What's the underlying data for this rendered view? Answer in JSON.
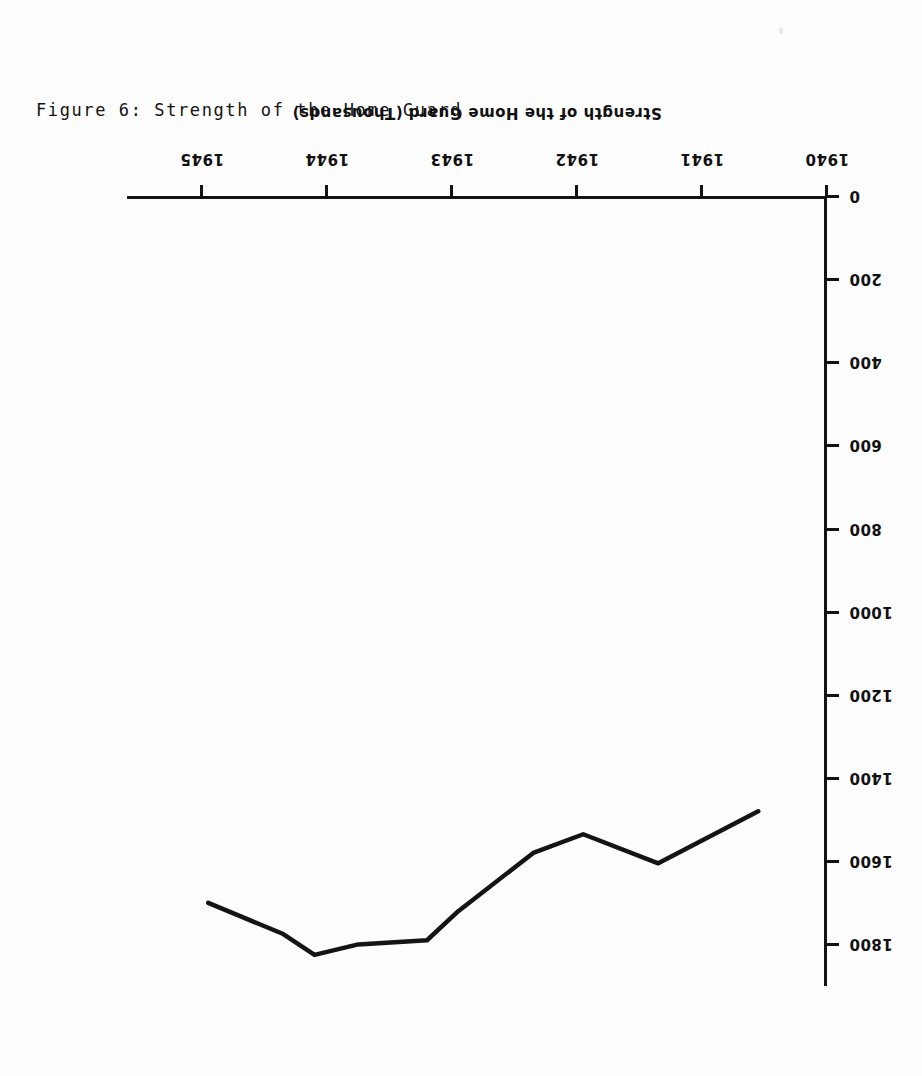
{
  "figure": {
    "caption": "Figure 6: Strength of the Home Guard",
    "orientation_note": "rotated-180"
  },
  "chart_data": {
    "type": "line",
    "title": "Figure 6: Strength of the Home Guard",
    "xlabel": "",
    "ylabel": "Strength of the Home Guard (Thousands)",
    "xlim": [
      1940,
      1945.6
    ],
    "ylim": [
      0,
      1900
    ],
    "grid": false,
    "legend": null,
    "x_tick_labels": [
      "1940",
      "1941",
      "1942",
      "1943",
      "1944",
      "1945"
    ],
    "x_tick_values": [
      1940,
      1941,
      1942,
      1943,
      1944,
      1945
    ],
    "y_tick_labels": [
      "0",
      "200",
      "400",
      "600",
      "800",
      "1000",
      "1200",
      "1400",
      "1600",
      "1800"
    ],
    "y_tick_values": [
      0,
      200,
      400,
      600,
      800,
      1000,
      1200,
      1400,
      1600,
      1800
    ],
    "series": [
      {
        "name": "Strength of the Home Guard",
        "x": [
          1940.55,
          1941.35,
          1941.95,
          1942.35,
          1942.95,
          1943.2,
          1943.75,
          1944.1,
          1944.35,
          1944.95
        ],
        "values": [
          1480,
          1605,
          1535,
          1580,
          1720,
          1790,
          1800,
          1825,
          1775,
          1700
        ]
      }
    ]
  }
}
